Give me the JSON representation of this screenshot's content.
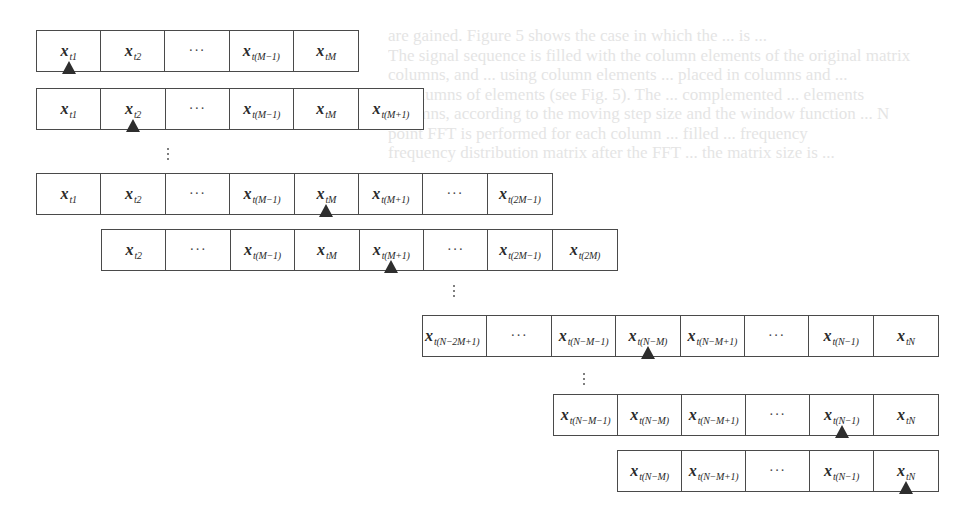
{
  "figure": {
    "background_bleed_text": [
      "are gained. Figure 5 shows the case in which the ... is ...",
      "The signal sequence is filled with the column elements of the original matrix",
      "columns, and ... using column elements ... placed in columns and ...",
      "N columns of elements (see Fig. 5). The ... complemented ... elements",
      "columns, according to the moving step size and the window function ... N",
      "point FFT is performed for each column ... filled ... frequency",
      "frequency distribution matrix after the FFT ... the matrix size is ..."
    ],
    "rows": [
      {
        "id": "row-1",
        "cells": [
          {
            "base": "x",
            "sub": "t1"
          },
          {
            "base": "x",
            "sub": "t2"
          },
          {
            "dots": "···"
          },
          {
            "base": "x",
            "sub": "t(M−1)"
          },
          {
            "base": "x",
            "sub": "tM"
          }
        ],
        "marker_cell": 0
      },
      {
        "id": "row-2",
        "cells": [
          {
            "base": "x",
            "sub": "t1"
          },
          {
            "base": "x",
            "sub": "t2"
          },
          {
            "dots": "···"
          },
          {
            "base": "x",
            "sub": "t(M−1)"
          },
          {
            "base": "x",
            "sub": "tM"
          },
          {
            "base": "x",
            "sub": "t(M+1)"
          }
        ],
        "marker_cell": 1
      },
      {
        "id": "row-3",
        "cells": [
          {
            "base": "x",
            "sub": "t1"
          },
          {
            "base": "x",
            "sub": "t2"
          },
          {
            "dots": "···"
          },
          {
            "base": "x",
            "sub": "t(M−1)"
          },
          {
            "base": "x",
            "sub": "tM"
          },
          {
            "base": "x",
            "sub": "t(M+1)"
          },
          {
            "dots": "···"
          },
          {
            "base": "x",
            "sub": "t(2M−1)"
          }
        ],
        "marker_cell": 4
      },
      {
        "id": "row-4",
        "cells": [
          {
            "base": "x",
            "sub": "t2"
          },
          {
            "dots": "···"
          },
          {
            "base": "x",
            "sub": "t(M−1)"
          },
          {
            "base": "x",
            "sub": "tM"
          },
          {
            "base": "x",
            "sub": "t(M+1)"
          },
          {
            "dots": "···"
          },
          {
            "base": "x",
            "sub": "t(2M−1)"
          },
          {
            "base": "x",
            "sub": "t(2M)"
          }
        ],
        "marker_cell": 4
      },
      {
        "id": "row-5",
        "cells": [
          {
            "base": "x",
            "sub": "t(N−2M+1)"
          },
          {
            "dots": "···"
          },
          {
            "base": "x",
            "sub": "t(N−M−1)"
          },
          {
            "base": "x",
            "sub": "t(N−M)"
          },
          {
            "base": "x",
            "sub": "t(N−M+1)"
          },
          {
            "dots": "···"
          },
          {
            "base": "x",
            "sub": "t(N−1)"
          },
          {
            "base": "x",
            "sub": "tN"
          }
        ],
        "marker_cell": 3
      },
      {
        "id": "row-6",
        "cells": [
          {
            "base": "x",
            "sub": "t(N−M−1)"
          },
          {
            "base": "x",
            "sub": "t(N−M)"
          },
          {
            "base": "x",
            "sub": "t(N−M+1)"
          },
          {
            "dots": "···"
          },
          {
            "base": "x",
            "sub": "t(N−1)"
          },
          {
            "base": "x",
            "sub": "tN"
          }
        ],
        "marker_cell": 4
      },
      {
        "id": "row-7",
        "cells": [
          {
            "base": "x",
            "sub": "t(N−M)"
          },
          {
            "base": "x",
            "sub": "t(N−M+1)"
          },
          {
            "dots": "···"
          },
          {
            "base": "x",
            "sub": "t(N−1)"
          },
          {
            "base": "x",
            "sub": "tN"
          }
        ],
        "marker_cell": 4
      }
    ],
    "ellipsis_markers": [
      {
        "id": "vdots-1",
        "label": "⋮"
      },
      {
        "id": "vdots-2",
        "label": "⋮"
      },
      {
        "id": "vdots-3",
        "label": "⋮"
      }
    ],
    "colors": {
      "border": "#4a4a4a",
      "text": "#2a2a2a",
      "marker": "#2e2e2e",
      "bleed_text": "#cfcfcf"
    }
  }
}
